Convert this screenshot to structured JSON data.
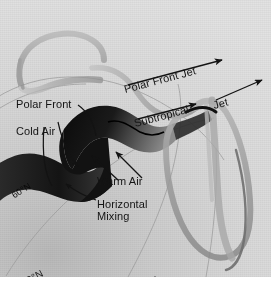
{
  "figure": {
    "type": "meteorological-diagram",
    "background_tone": "#d6d6d6",
    "ink_color": "#141414",
    "front_band_color": "#101010",
    "jet_band_color": "#9a9a9a"
  },
  "labels": {
    "polar_front": "Polar Front",
    "cold_air": "Cold Air",
    "warm_air": "Warm Air",
    "horizontal_mixing_line1": "Horizontal",
    "horizontal_mixing_line2": "Mixing",
    "polar_front_jet": "Polar Front Jet",
    "subtropical": "Subtropical",
    "jet": "Jet"
  },
  "latitudes": [
    {
      "name": "lat-60n",
      "text": "60°N"
    },
    {
      "name": "lat-30n",
      "text": "30°N"
    },
    {
      "name": "lat-0",
      "text": "0°"
    }
  ]
}
